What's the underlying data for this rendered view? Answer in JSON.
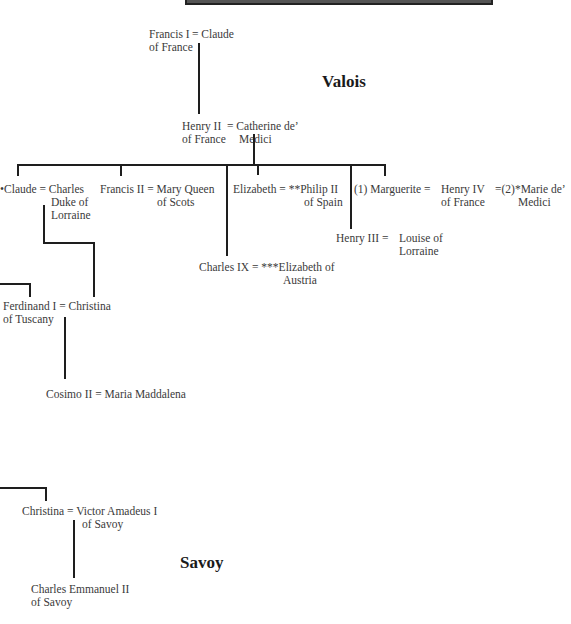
{
  "houses": {
    "valois": "Valois",
    "savoy": "Savoy"
  },
  "people": {
    "francis_i": [
      "Francis I",
      "of France"
    ],
    "claude_wife": "= Claude",
    "henry_ii": [
      "Henry II",
      "of France"
    ],
    "catherine": [
      "= Catherine de’",
      "Medici"
    ],
    "claude_daughter": "•Claude = Charles",
    "charles_lorraine": [
      "Duke of",
      "Lorraine"
    ],
    "francis_ii": "Francis II = Mary Queen",
    "mary_scots_2": "of Scots",
    "elizabeth": "Elizabeth = **Philip II",
    "philip_2": "of Spain",
    "marguerite": "(1)  Marguerite = ",
    "henry_iv": [
      "Henry IV",
      "of France"
    ],
    "marie": [
      "=(2)*Marie de’",
      "Medici"
    ],
    "henry_iii": "Henry III = ",
    "louise": [
      "Louise of",
      "Lorraine"
    ],
    "charles_ix": "Charles IX = ***Elizabeth of",
    "austria": "Austria",
    "ferdinand": [
      "Ferdinand I = Christina",
      "of Tuscany"
    ],
    "cosimo": "Cosimo II = Maria Maddalena",
    "christina_savoy": [
      "Christina = Victor Amadeus I",
      "of Savoy"
    ],
    "charles_emmanuel": [
      "Charles Emmanuel II",
      "of Savoy"
    ]
  }
}
